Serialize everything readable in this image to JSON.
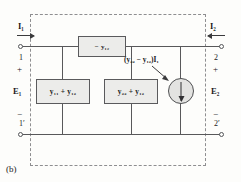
{
  "figure": {
    "caption": "(b)",
    "type": "two-port-equivalent-circuit"
  },
  "ports": {
    "left": {
      "current_label": "I₁",
      "terminal_top": "1",
      "terminal_bottom": "1′",
      "polarity_top": "+",
      "polarity_bottom": "−",
      "voltage_label": "E₁",
      "current_direction": "into-network"
    },
    "right": {
      "current_label": "I₂",
      "terminal_top": "2",
      "terminal_bottom": "2′",
      "polarity_top": "+",
      "polarity_bottom": "−",
      "voltage_label": "E₂",
      "current_direction": "into-network"
    }
  },
  "elements": {
    "series_branch": {
      "label": "− y₁₂",
      "position": "top-series"
    },
    "shunt_left": {
      "label": "y₁₁ + y₁₂",
      "position": "left-shunt"
    },
    "shunt_right": {
      "label": "y₂₂ + y₁₂",
      "position": "right-shunt"
    },
    "dependent_source": {
      "label": "(y₂₂ − y₁₂)I₁",
      "symbol": "current-source",
      "arrow_direction": "down"
    }
  },
  "colors": {
    "wire": "#58585a",
    "box_fill": "#ececea",
    "box_stroke": "#5a5a5c",
    "dashed_border": "#8e8e90",
    "source_fill": "#e3e3e1",
    "text": "#1b1b1b",
    "background": "#fdfdfb"
  }
}
